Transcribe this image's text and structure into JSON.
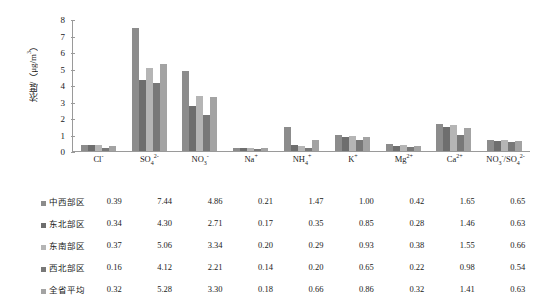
{
  "chart_data": {
    "type": "bar",
    "title": "",
    "xlabel": "",
    "ylabel": "浓度/（μg/m³）",
    "ylim": [
      0,
      8
    ],
    "yticks": [
      8,
      7,
      6,
      5,
      4,
      3,
      2,
      1,
      0
    ],
    "grid": false,
    "legend_position": "table-left",
    "categories": [
      "Cl⁻",
      "SO₄²⁻",
      "NO₃⁻",
      "Na⁺",
      "NH₄⁺",
      "K⁺",
      "Mg²⁺",
      "Ca²⁺",
      "NO₃⁻/SO₄²⁻"
    ],
    "categories_html": [
      "Cl<sup>-</sup>",
      "SO<sub>4</sub><sup>2-</sup>",
      "NO<sub>3</sub><sup>-</sup>",
      "Na<sup>+</sup>",
      "NH<sub>4</sub><sup>+</sup>",
      "K<sup>+</sup>",
      "Mg<sup>2+</sup>",
      "Ca<sup>2+</sup>",
      "NO<sub>3</sub><sup>-</sup>/SO<sub>4</sub><sup>2-</sup>"
    ],
    "series": [
      {
        "name": "中西部区",
        "color": "#8c8c8c",
        "values": [
          0.39,
          7.44,
          4.86,
          0.21,
          1.47,
          1.0,
          0.42,
          1.65,
          0.65
        ]
      },
      {
        "name": "东北部区",
        "color": "#6e6e6e",
        "values": [
          0.34,
          4.3,
          2.71,
          0.17,
          0.35,
          0.85,
          0.28,
          1.46,
          0.63
        ]
      },
      {
        "name": "东南部区",
        "color": "#b5b5b5",
        "values": [
          0.37,
          5.06,
          3.34,
          0.2,
          0.29,
          0.93,
          0.38,
          1.55,
          0.66
        ]
      },
      {
        "name": "西北部区",
        "color": "#787878",
        "values": [
          0.16,
          4.12,
          2.21,
          0.14,
          0.2,
          0.65,
          0.22,
          0.98,
          0.54
        ]
      },
      {
        "name": "全省平均",
        "color": "#a3a3a3",
        "values": [
          0.32,
          5.28,
          3.3,
          0.18,
          0.66,
          0.86,
          0.32,
          1.41,
          0.63
        ]
      }
    ]
  },
  "axis": {
    "y_label": "浓度/（μg/m³）",
    "y_label_prefix": "浓度/（μg/m",
    "y_label_exp": "3",
    "y_label_suffix": "）",
    "tick_labels": [
      "8",
      "7",
      "6",
      "5",
      "4",
      "3",
      "2",
      "1",
      "0"
    ]
  },
  "colors": {
    "axis": "#9a9a9a",
    "text": "#1a1a1a",
    "background": "#ffffff",
    "series_1": "#8c8c8c",
    "series_2": "#6e6e6e",
    "series_3": "#b5b5b5",
    "series_4": "#787878",
    "series_5": "#a3a3a3"
  }
}
